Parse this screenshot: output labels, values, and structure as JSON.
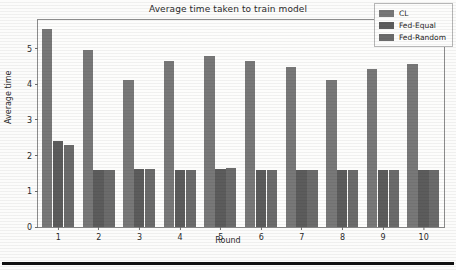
{
  "chart_data": {
    "type": "bar",
    "title": "Average time taken to train model",
    "xlabel": "Round",
    "ylabel": "Average time",
    "categories": [
      "1",
      "2",
      "3",
      "4",
      "5",
      "6",
      "7",
      "8",
      "9",
      "10"
    ],
    "series": [
      {
        "name": "CL",
        "color": "#787878",
        "values": [
          5.55,
          4.95,
          4.13,
          4.65,
          4.8,
          4.64,
          4.48,
          4.13,
          4.42,
          4.58
        ]
      },
      {
        "name": "Fed-Equal",
        "color": "#5c5c5c",
        "values": [
          2.42,
          1.6,
          1.62,
          1.6,
          1.63,
          1.6,
          1.59,
          1.6,
          1.59,
          1.59
        ]
      },
      {
        "name": "Fed-Random",
        "color": "#6b6b6b",
        "values": [
          2.31,
          1.61,
          1.63,
          1.61,
          1.64,
          1.61,
          1.6,
          1.6,
          1.6,
          1.6
        ]
      }
    ],
    "ylim": [
      0,
      5.8
    ],
    "yticks": [
      "0",
      "1",
      "2",
      "3",
      "4",
      "5"
    ],
    "ytick_values": [
      0,
      1,
      2,
      3,
      4,
      5
    ],
    "grid": false,
    "legend_position": "top-right"
  },
  "legend": {
    "entries": [
      {
        "label": "CL"
      },
      {
        "label": "Fed-Equal"
      },
      {
        "label": "Fed-Random"
      }
    ]
  }
}
